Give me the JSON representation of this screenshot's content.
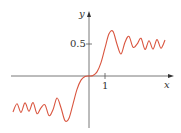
{
  "chart_data": {
    "type": "line",
    "title": "",
    "xlabel": "x",
    "ylabel": "y",
    "x_ticks": [
      {
        "value": 1,
        "label": "1"
      }
    ],
    "y_ticks": [
      {
        "value": 0.5,
        "label": "0.5"
      }
    ],
    "xlim": [
      -4.9,
      5.2
    ],
    "ylim": [
      -0.8,
      1.0
    ],
    "grid": false,
    "legend": null,
    "series": [
      {
        "name": "S(x)",
        "color": "#d9553f",
        "x": [
          -4.75,
          -4.5,
          -4.25,
          -4.0,
          -3.75,
          -3.5,
          -3.25,
          -3.0,
          -2.75,
          -2.5,
          -2.25,
          -2.0,
          -1.75,
          -1.5,
          -1.25,
          -1.0,
          -0.75,
          -0.5,
          -0.25,
          0,
          0.25,
          0.5,
          0.75,
          1.0,
          1.25,
          1.5,
          1.75,
          2.0,
          2.25,
          2.5,
          2.75,
          3.0,
          3.25,
          3.5,
          3.75,
          4.0,
          4.25,
          4.5,
          4.75
        ],
        "values": [
          -0.5627,
          -0.4342,
          -0.5688,
          -0.4205,
          -0.55,
          -0.4152,
          -0.5886,
          -0.4963,
          -0.4509,
          -0.6192,
          -0.5279,
          -0.3434,
          -0.4963,
          -0.6975,
          -0.6597,
          -0.4383,
          -0.2089,
          -0.0647,
          -0.0082,
          0,
          0.0082,
          0.0647,
          0.2089,
          0.4383,
          0.6597,
          0.6975,
          0.4963,
          0.3434,
          0.5279,
          0.6192,
          0.4509,
          0.4963,
          0.5886,
          0.4152,
          0.55,
          0.4205,
          0.5688,
          0.4342,
          0.5627
        ]
      }
    ]
  },
  "axes": {
    "x_label": "x",
    "y_label": "y",
    "x_tick_label": "1",
    "y_tick_label": "0.5"
  }
}
